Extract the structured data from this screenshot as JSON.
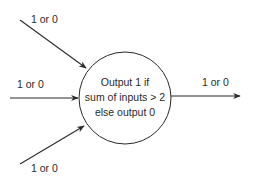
{
  "diagram": {
    "type": "perceptron-threshold-neuron",
    "node": {
      "lines": [
        "Output 1 if",
        "sum of inputs > 2",
        "else output 0"
      ]
    },
    "inputs": [
      {
        "label": "1 or 0",
        "position": "top"
      },
      {
        "label": "1 or 0",
        "position": "middle"
      },
      {
        "label": "1 or 0",
        "position": "bottom"
      }
    ],
    "output": {
      "label": "1 or 0"
    },
    "colors": {
      "stroke": "#2a2a2a",
      "background": "#ffffff"
    }
  }
}
